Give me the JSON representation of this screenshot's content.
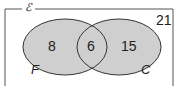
{
  "diagram": {
    "type": "venn",
    "universal_label": "ℰ",
    "sets": [
      {
        "name": "F",
        "only_count": "8"
      },
      {
        "name": "C",
        "only_count": "15"
      }
    ],
    "intersection_count": "6",
    "outside_count": "21",
    "colors": {
      "fill": "#cfcfcf",
      "stroke": "#333333",
      "border": "#555555"
    }
  }
}
